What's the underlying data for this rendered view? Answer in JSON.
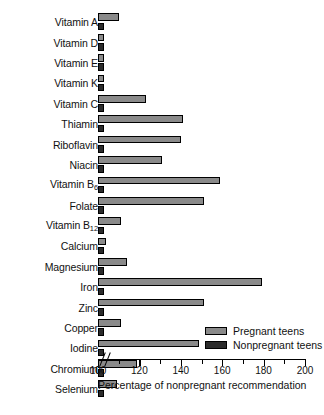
{
  "chart_data": {
    "type": "bar",
    "orientation": "horizontal",
    "title": "",
    "xlabel": "Percentage of nonpregnant recommendation",
    "ylabel": "",
    "xlim": [
      100,
      200
    ],
    "axis_break": true,
    "zero_tick_label": "0",
    "grid": false,
    "legend_position": "bottom-right",
    "xticks": [
      100,
      110,
      120,
      130,
      140,
      150,
      160,
      170,
      180,
      190,
      200
    ],
    "xtick_labels": [
      "100",
      "",
      "120",
      "",
      "140",
      "",
      "160",
      "",
      "180",
      "",
      "200"
    ],
    "categories": [
      "Vitamin A",
      "Vitamin D",
      "Vitamin E",
      "Vitamin K",
      "Vitamin C",
      "Thiamin",
      "Riboflavin",
      "Niacin",
      "Vitamin B6",
      "Folate",
      "Vitamin B12",
      "Calcium",
      "Magnesium",
      "Iron",
      "Zinc",
      "Copper",
      "Iodine",
      "Chromium",
      "Selenium"
    ],
    "categories_html": [
      "Vitamin A",
      "Vitamin D",
      "Vitamin E",
      "Vitamin K",
      "Vitamin C",
      "Thiamin",
      "Riboflavin",
      "Niacin",
      "Vitamin B<sub>6</sub>",
      "Folate",
      "Vitamin B<sub>12</sub>",
      "Calcium",
      "Magnesium",
      "Iron",
      "Zinc",
      "Copper",
      "Iodine",
      "Chromium",
      "Selenium"
    ],
    "series": [
      {
        "name": "Pregnant teens",
        "color": "#8a8a8a",
        "values": [
          110,
          103,
          103,
          103,
          123,
          141,
          140,
          131,
          159,
          151,
          111,
          104,
          114,
          179,
          151,
          111,
          149,
          119,
          109
        ]
      },
      {
        "name": "Nonpregnant teens",
        "color": "#2b2b2b",
        "values": [
          103,
          103,
          103,
          103,
          103,
          103,
          103,
          103,
          103,
          103,
          103,
          103,
          103,
          103,
          103,
          103,
          103,
          103,
          103
        ]
      }
    ]
  },
  "legend": {
    "items": [
      {
        "label": "Pregnant teens",
        "color": "#8a8a8a"
      },
      {
        "label": "Nonpregnant teens",
        "color": "#2b2b2b"
      }
    ]
  }
}
